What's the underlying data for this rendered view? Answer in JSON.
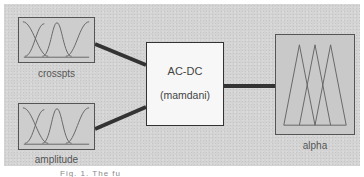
{
  "diagram": {
    "inputs": [
      {
        "name": "crosspts",
        "mf_shape": "gaussian",
        "mf_count": 3
      },
      {
        "name": "amplitude",
        "mf_shape": "gaussian",
        "mf_count": 3
      }
    ],
    "system": {
      "name": "AC-DC",
      "type": "(mamdani)"
    },
    "outputs": [
      {
        "name": "alpha",
        "mf_shape": "triangular",
        "mf_count": 3
      }
    ],
    "caption": "Fig. 1. The fu"
  },
  "colors": {
    "panel": "#d3d3d3",
    "wire": "#333333",
    "system_box": "#f7f7f7",
    "mf_line": "#666666"
  }
}
